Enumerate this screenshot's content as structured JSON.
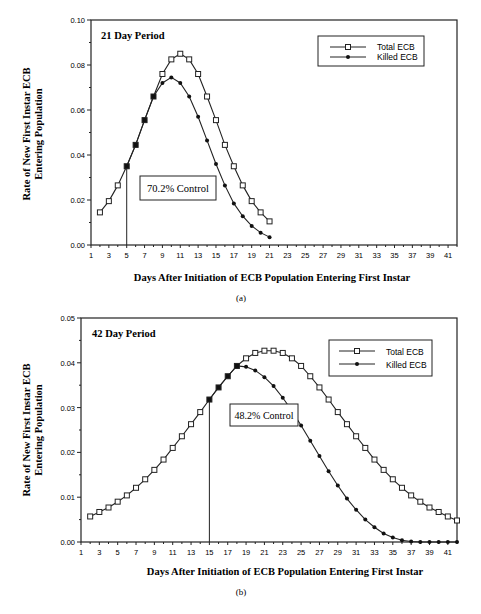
{
  "chart_data": [
    {
      "type": "line",
      "panel_label": "(a)",
      "title": "21 Day Period",
      "xlabel": "Days After Initiation of ECB Population Entering First Instar",
      "ylabel": "Rate of New First Instar ECB Entering Population",
      "xlim": [
        1,
        42
      ],
      "ylim": [
        0,
        0.1
      ],
      "x_ticks": [
        1,
        3,
        5,
        7,
        9,
        11,
        13,
        15,
        17,
        19,
        21,
        23,
        25,
        27,
        29,
        31,
        33,
        35,
        37,
        39,
        41
      ],
      "y_ticks": [
        "0.00",
        "0.02",
        "0.04",
        "0.06",
        "0.08",
        "0.10"
      ],
      "legend": {
        "position": "upper right",
        "entries": [
          "Total ECB",
          "Killed ECB"
        ]
      },
      "annotation": {
        "text": "70.2% Control",
        "vline_x": 5
      },
      "grid": false,
      "series": [
        {
          "name": "Total ECB",
          "marker": "open-square",
          "x": [
            2,
            3,
            4,
            5,
            6,
            7,
            8,
            9,
            10,
            11,
            12,
            13,
            14,
            15,
            16,
            17,
            18,
            19,
            20,
            21
          ],
          "values": [
            0.0145,
            0.0195,
            0.0265,
            0.035,
            0.0445,
            0.0555,
            0.066,
            0.076,
            0.0825,
            0.085,
            0.0825,
            0.076,
            0.066,
            0.0555,
            0.0445,
            0.035,
            0.0265,
            0.0195,
            0.0145,
            0.0105
          ]
        },
        {
          "name": "Killed ECB",
          "marker": "filled-diamond",
          "x": [
            5,
            6,
            7,
            8,
            9,
            10,
            11,
            12,
            13,
            14,
            15,
            16,
            17,
            18,
            19,
            20,
            21
          ],
          "values": [
            0.035,
            0.0445,
            0.0555,
            0.066,
            0.072,
            0.0745,
            0.072,
            0.066,
            0.057,
            0.0465,
            0.036,
            0.0265,
            0.0185,
            0.0128,
            0.0085,
            0.0055,
            0.0035
          ]
        }
      ]
    },
    {
      "type": "line",
      "panel_label": "(b)",
      "title": "42 Day Period",
      "xlabel": "Days After Initiation of ECB Population Entering First Instar",
      "ylabel": "Rate of New First Instar ECB Entering Population",
      "xlim": [
        1,
        42
      ],
      "ylim": [
        0,
        0.05
      ],
      "x_ticks": [
        1,
        3,
        5,
        7,
        9,
        11,
        13,
        15,
        17,
        19,
        21,
        23,
        25,
        27,
        29,
        31,
        33,
        35,
        37,
        39,
        41
      ],
      "y_ticks": [
        "0.00",
        "0.01",
        "0.02",
        "0.03",
        "0.04",
        "0.05"
      ],
      "legend": {
        "position": "upper right",
        "entries": [
          "Total ECB",
          "Killed ECB"
        ]
      },
      "annotation": {
        "text": "48.2% Control",
        "vline_x": 15
      },
      "grid": false,
      "series": [
        {
          "name": "Total ECB",
          "marker": "open-square",
          "x": [
            2,
            3,
            4,
            5,
            6,
            7,
            8,
            9,
            10,
            11,
            12,
            13,
            14,
            15,
            16,
            17,
            18,
            19,
            20,
            21,
            22,
            23,
            24,
            25,
            26,
            27,
            28,
            29,
            30,
            31,
            32,
            33,
            34,
            35,
            36,
            37,
            38,
            39,
            40,
            41,
            42
          ],
          "values": [
            0.0057,
            0.0067,
            0.0077,
            0.009,
            0.0104,
            0.0121,
            0.014,
            0.0161,
            0.0184,
            0.021,
            0.0236,
            0.0263,
            0.029,
            0.0318,
            0.0345,
            0.037,
            0.0393,
            0.041,
            0.0422,
            0.0427,
            0.0427,
            0.0422,
            0.041,
            0.0393,
            0.037,
            0.0345,
            0.0318,
            0.029,
            0.0263,
            0.0236,
            0.021,
            0.0184,
            0.0161,
            0.014,
            0.0121,
            0.0104,
            0.009,
            0.0077,
            0.0067,
            0.0057,
            0.0048
          ]
        },
        {
          "name": "Killed ECB",
          "marker": "filled-diamond",
          "x": [
            15,
            16,
            17,
            18,
            19,
            20,
            21,
            22,
            23,
            24,
            25,
            26,
            27,
            28,
            29,
            30,
            31,
            32,
            33,
            34,
            35,
            36,
            37,
            38,
            39,
            40,
            41,
            42
          ],
          "values": [
            0.0318,
            0.0345,
            0.037,
            0.0393,
            0.0391,
            0.0383,
            0.0368,
            0.0348,
            0.0322,
            0.0293,
            0.026,
            0.0226,
            0.0192,
            0.0158,
            0.0126,
            0.0097,
            0.0072,
            0.005,
            0.0033,
            0.0019,
            0.001,
            0.0004,
            0.0001,
            0.0,
            0.0,
            0.0,
            0.0,
            0.0
          ]
        }
      ]
    }
  ],
  "charts": {
    "a": {
      "title": "21 Day Period",
      "ylabel_line1": "Rate of New First Instar ECB",
      "ylabel_line2": "Entering Population",
      "xlabel": "Days After Initiation of ECB Population Entering First Instar",
      "caption": "(a)",
      "annotation": "70.2% Control",
      "legend_total": "Total ECB",
      "legend_killed": "Killed ECB"
    },
    "b": {
      "title": "42 Day Period",
      "ylabel_line1": "Rate of New First Instar ECB",
      "ylabel_line2": "Entering Population",
      "xlabel": "Days After Initiation of ECB Population Entering First Instar",
      "caption": "(b)",
      "annotation": "48.2% Control",
      "legend_total": "Total ECB",
      "legend_killed": "Killed ECB"
    }
  }
}
